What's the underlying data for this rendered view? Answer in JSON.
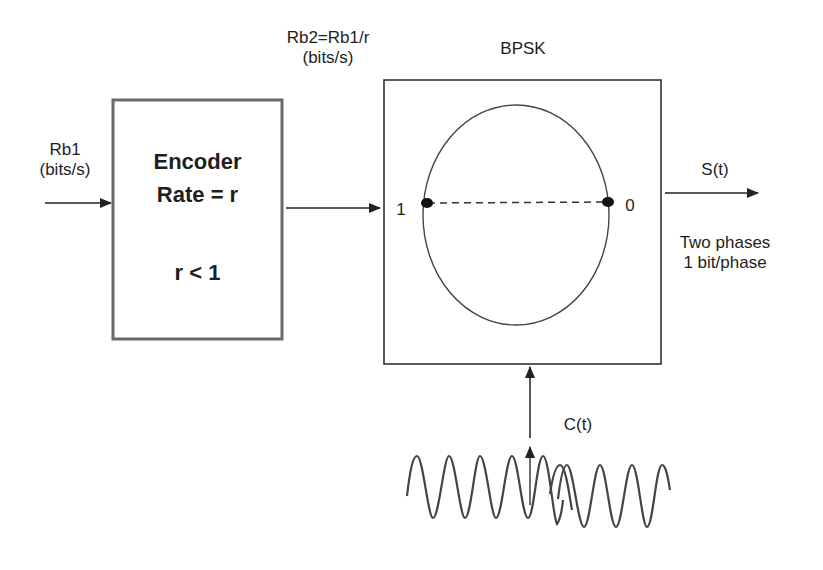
{
  "input": {
    "rate_label": "Rb1",
    "unit_label": "(bits/s)"
  },
  "encoder": {
    "title": "Encoder",
    "rate_line": "Rate = r",
    "constraint": "r < 1"
  },
  "intermediate": {
    "rate_label": "Rb2=Rb1/r",
    "unit_label": "(bits/s)"
  },
  "modulator": {
    "title": "BPSK",
    "constellation": {
      "left_point_label": "1",
      "right_point_label": "0"
    }
  },
  "output": {
    "signal_label": "S(t)",
    "note_line1": "Two phases",
    "note_line2": "1 bit/phase"
  },
  "carrier": {
    "signal_label": "C(t)"
  },
  "colors": {
    "stroke": "#333333",
    "encoder_border": "#666666",
    "background": "#ffffff"
  }
}
